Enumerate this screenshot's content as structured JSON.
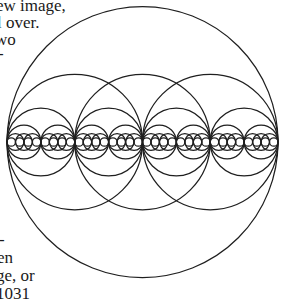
{
  "page": {
    "text_fragments_top": [
      {
        "text": "ew image,",
        "x": -4,
        "y": -3
      },
      {
        "text": "l over.",
        "x": -3,
        "y": 14
      },
      {
        "text": "wo",
        "x": -5,
        "y": 31
      },
      {
        "text": "-",
        "x": -2,
        "y": 45
      }
    ],
    "text_fragments_bottom": [
      {
        "text": "-",
        "x": -1,
        "y": 231
      },
      {
        "text": "en",
        "x": -3,
        "y": 249
      },
      {
        "text": "ge, or",
        "x": -4,
        "y": 267
      },
      {
        "text": "  1031  ",
        "x": -4,
        "y": 285
      }
    ]
  },
  "figure": {
    "type": "recursive-nested-circles",
    "stroke_color": "#1f1f1f",
    "outer_circle": {
      "cx": 142.5,
      "cy": 142,
      "r": 135.5
    },
    "center_line_y": 142,
    "levels": [
      {
        "name": "level-1",
        "r": 67.75,
        "centers_x": [
          74.75,
          142.5,
          210.25
        ]
      },
      {
        "name": "level-2",
        "r": 33.875,
        "centers_x": [
          40.875,
          108.625,
          176.375,
          244.125
        ]
      },
      {
        "name": "level-3",
        "r": 16.9375,
        "tangent_pairs": true
      },
      {
        "name": "level-4",
        "r": 8.46875,
        "with_center_overlap": true
      },
      {
        "name": "level-5",
        "r": 4.234375,
        "chain": true
      }
    ]
  }
}
